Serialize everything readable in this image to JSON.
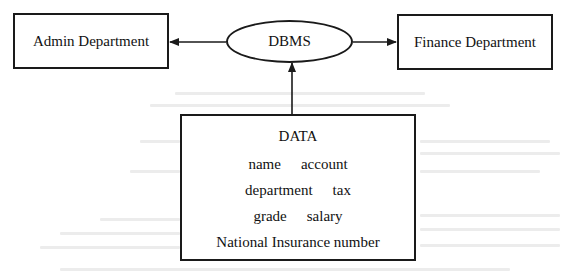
{
  "diagram": {
    "nodes": {
      "admin": {
        "label": "Admin Department",
        "shape": "rectangle"
      },
      "dbms": {
        "label": "DBMS",
        "shape": "ellipse"
      },
      "finance": {
        "label": "Finance Department",
        "shape": "rectangle"
      },
      "data": {
        "shape": "rectangle",
        "title": "DATA",
        "fields": [
          [
            "name",
            "account"
          ],
          [
            "department",
            "tax"
          ],
          [
            "grade",
            "salary"
          ],
          [
            "National Insurance number"
          ]
        ]
      }
    },
    "edges": [
      {
        "from": "dbms",
        "to": "admin",
        "arrow": "end"
      },
      {
        "from": "dbms",
        "to": "finance",
        "arrow": "end"
      },
      {
        "from": "data",
        "to": "dbms",
        "arrow": "end"
      }
    ],
    "colors": {
      "stroke": "#1a1a1a",
      "text": "#111111",
      "background": "#ffffff"
    }
  }
}
